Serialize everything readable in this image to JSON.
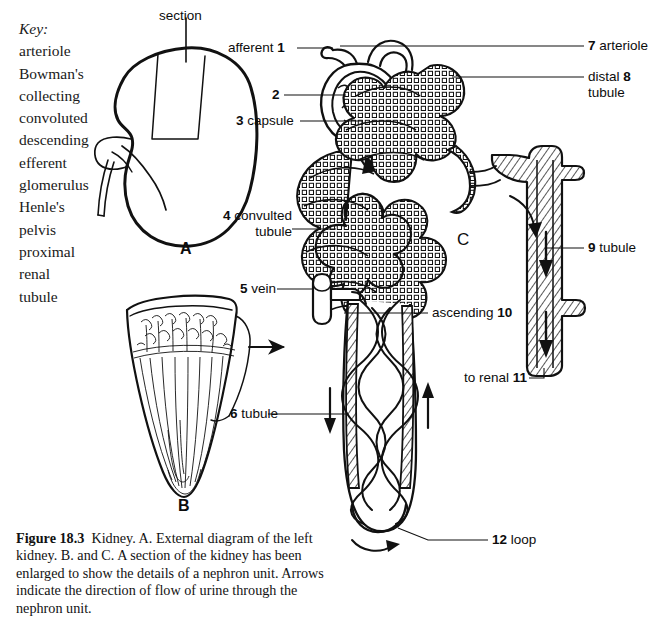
{
  "figure": {
    "key_title": "Key:",
    "key_items": [
      "arteriole",
      "Bowman's",
      "collecting",
      "convoluted",
      "descending",
      "efferent",
      "glomerulus",
      "Henle's",
      "pelvis",
      "proximal",
      "renal",
      "tubule"
    ],
    "caption_number": "Figure 18.3",
    "caption_text": "Kidney. A. External diagram of the left kidney. B. and C. A section of the kidney has been enlarged to show the details of a nephron unit. Arrows indicate the direction of flow of urine through the nephron unit.",
    "panel_a": "A",
    "panel_b": "B",
    "panel_c": "C",
    "section_label": "section",
    "labels": {
      "l1_pre": "afferent",
      "l1_num": "1",
      "l2_num": "2",
      "l3_num": "3",
      "l3_post": "capsule",
      "l4_num": "4",
      "l4_post": "convulted",
      "l4_line2": "tubule",
      "l5_num": "5",
      "l5_post": "vein",
      "l6_num": "6",
      "l6_post": "tubule",
      "l7_num": "7",
      "l7_post": "arteriole",
      "l8_pre": "distal",
      "l8_num": "8",
      "l8_line2": "tubule",
      "l9_num": "9",
      "l9_post": "tubule",
      "l10_pre": "ascending",
      "l10_num": "10",
      "l11_pre": "to renal",
      "l11_num": "11",
      "l12_num": "12",
      "l12_post": "loop"
    },
    "colors": {
      "ink": "#111111",
      "background": "#ffffff"
    }
  }
}
